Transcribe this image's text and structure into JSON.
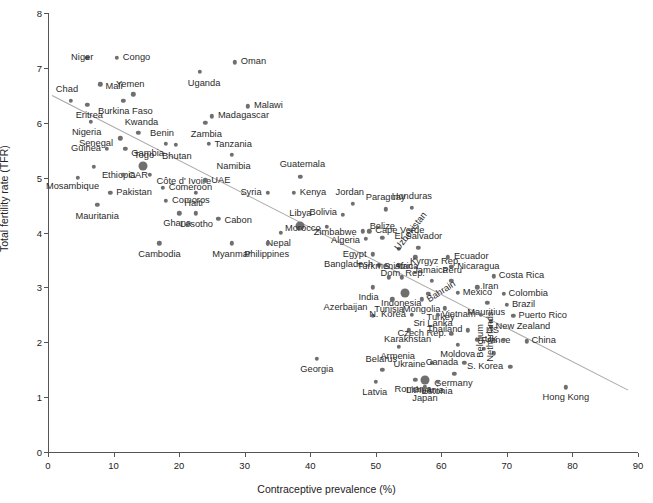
{
  "chart_data": {
    "type": "scatter",
    "title": "",
    "xlabel": "Contraceptive prevalence (%)",
    "ylabel": "Total fertility rate (TFR)",
    "xlim": [
      0,
      90
    ],
    "ylim": [
      0,
      8
    ],
    "xticks": [
      0,
      10,
      20,
      30,
      40,
      50,
      60,
      70,
      80,
      90
    ],
    "yticks": [
      0,
      1,
      2,
      3,
      4,
      5,
      6,
      7,
      8
    ],
    "grid": false,
    "legend": null,
    "point_color": "#6f6f6f",
    "trendline_color": "#a8a8a8",
    "trendline": {
      "x0": 0.6,
      "y0": 6.5,
      "x1": 88.5,
      "y1": 1.13
    },
    "points": [
      {
        "name": "Niger",
        "x": 6.0,
        "y": 7.18,
        "lx": 6,
        "ly": 0,
        "a": "r",
        "big": false
      },
      {
        "name": "Congo",
        "x": 10.5,
        "y": 7.18,
        "lx": 6,
        "ly": 0,
        "a": "l",
        "big": false
      },
      {
        "name": "Oman",
        "x": 28.5,
        "y": 7.1,
        "lx": 6,
        "ly": 0,
        "a": "l",
        "big": false
      },
      {
        "name": "Uganda",
        "x": 23.2,
        "y": 6.93,
        "lx": 4,
        "ly": 12,
        "a": "c",
        "big": false
      },
      {
        "name": "Mali",
        "x": 8.0,
        "y": 6.7,
        "lx": 5,
        "ly": 3,
        "a": "l",
        "big": false
      },
      {
        "name": "Yemen",
        "x": 13.0,
        "y": 6.52,
        "lx": -3,
        "ly": -9,
        "a": "c",
        "big": false
      },
      {
        "name": "Chad",
        "x": 3.5,
        "y": 6.4,
        "lx": -4,
        "ly": -11,
        "a": "c",
        "big": false
      },
      {
        "name": "Burkina Faso",
        "x": 11.5,
        "y": 6.4,
        "lx": 2,
        "ly": 11,
        "a": "c",
        "big": false
      },
      {
        "name": "Malawi",
        "x": 30.5,
        "y": 6.3,
        "lx": 6,
        "ly": 0,
        "a": "l",
        "big": false
      },
      {
        "name": "Eritrea",
        "x": 6.0,
        "y": 6.33,
        "lx": 2,
        "ly": 11,
        "a": "c",
        "big": false
      },
      {
        "name": "Madagascar",
        "x": 25.0,
        "y": 6.12,
        "lx": 6,
        "ly": 0,
        "a": "l",
        "big": false
      },
      {
        "name": "Nigeria",
        "x": 6.5,
        "y": 6.02,
        "lx": -4,
        "ly": 11,
        "a": "c",
        "big": false
      },
      {
        "name": "Zambia",
        "x": 24.0,
        "y": 6.0,
        "lx": 1,
        "ly": 12,
        "a": "c",
        "big": false
      },
      {
        "name": "Kwanda",
        "x": 13.8,
        "y": 5.82,
        "lx": 3,
        "ly": -10,
        "a": "c",
        "big": false
      },
      {
        "name": "Senegal",
        "x": 11.0,
        "y": 5.72,
        "lx": -7,
        "ly": 6,
        "a": "r",
        "big": false
      },
      {
        "name": "Benin",
        "x": 18.0,
        "y": 5.62,
        "lx": -4,
        "ly": -10,
        "a": "c",
        "big": false
      },
      {
        "name": "Tanzania",
        "x": 24.5,
        "y": 5.62,
        "lx": 6,
        "ly": 1,
        "a": "l",
        "big": false
      },
      {
        "name": "Guinea",
        "x": 9.0,
        "y": 5.52,
        "lx": -6,
        "ly": 0,
        "a": "r",
        "big": false
      },
      {
        "name": "Gambia",
        "x": 11.8,
        "y": 5.52,
        "lx": 6,
        "ly": 5,
        "a": "l",
        "big": false
      },
      {
        "name": "Bhutan",
        "x": 19.5,
        "y": 5.6,
        "lx": 1,
        "ly": 12,
        "a": "c",
        "big": false
      },
      {
        "name": "Namibia",
        "x": 28.0,
        "y": 5.42,
        "lx": 2,
        "ly": 12,
        "a": "c",
        "big": false
      },
      {
        "name": "Ethiopia",
        "x": 7.0,
        "y": 5.2,
        "lx": 8,
        "ly": 9,
        "a": "l",
        "big": false
      },
      {
        "name": "Togo",
        "x": 14.5,
        "y": 5.22,
        "lx": 1,
        "ly": -10,
        "a": "c",
        "big": true
      },
      {
        "name": "CAR",
        "x": 11.5,
        "y": 5.05,
        "lx": 5,
        "ly": 1,
        "a": "l",
        "big": false
      },
      {
        "name": "Côte d' Ivoire",
        "x": 15.5,
        "y": 5.05,
        "lx": 7,
        "ly": 7,
        "a": "l",
        "big": false
      },
      {
        "name": "Guatemala",
        "x": 38.5,
        "y": 5.02,
        "lx": 2,
        "ly": -12,
        "a": "c",
        "big": false
      },
      {
        "name": "Mosambique",
        "x": 4.5,
        "y": 5.0,
        "lx": -5,
        "ly": 9,
        "a": "c",
        "big": false
      },
      {
        "name": "UAE",
        "x": 24.0,
        "y": 4.95,
        "lx": 6,
        "ly": 1,
        "a": "l",
        "big": false
      },
      {
        "name": "Comeroon",
        "x": 17.5,
        "y": 4.82,
        "lx": 6,
        "ly": 0,
        "a": "l",
        "big": false
      },
      {
        "name": "Pakistan",
        "x": 9.5,
        "y": 4.72,
        "lx": 6,
        "ly": 0,
        "a": "l",
        "big": false
      },
      {
        "name": "Syria",
        "x": 33.5,
        "y": 4.72,
        "lx": -6,
        "ly": 0,
        "a": "r",
        "big": false
      },
      {
        "name": "Kenya",
        "x": 37.5,
        "y": 4.72,
        "lx": 6,
        "ly": 0,
        "a": "l",
        "big": false
      },
      {
        "name": "Haiti",
        "x": 22.5,
        "y": 4.72,
        "lx": -2,
        "ly": 11,
        "a": "c",
        "big": false
      },
      {
        "name": "Comoros",
        "x": 18.0,
        "y": 4.58,
        "lx": 6,
        "ly": 0,
        "a": "l",
        "big": false
      },
      {
        "name": "Jordan",
        "x": 46.5,
        "y": 4.52,
        "lx": -3,
        "ly": -11,
        "a": "c",
        "big": false
      },
      {
        "name": "Paraguay",
        "x": 51.5,
        "y": 4.42,
        "lx": 0,
        "ly": -11,
        "a": "c",
        "big": false
      },
      {
        "name": "Honduras",
        "x": 55.5,
        "y": 4.45,
        "lx": 0,
        "ly": -11,
        "a": "c",
        "big": false
      },
      {
        "name": "Mauritania",
        "x": 7.5,
        "y": 4.5,
        "lx": 0,
        "ly": 12,
        "a": "c",
        "big": false
      },
      {
        "name": "Bolivia",
        "x": 45.0,
        "y": 4.32,
        "lx": -6,
        "ly": -2,
        "a": "r",
        "big": false
      },
      {
        "name": "Ghana",
        "x": 20.0,
        "y": 4.35,
        "lx": -2,
        "ly": 11,
        "a": "c",
        "big": false
      },
      {
        "name": "Lesotho",
        "x": 22.5,
        "y": 4.35,
        "lx": 1,
        "ly": 12,
        "a": "c",
        "big": false
      },
      {
        "name": "Cabon",
        "x": 26.0,
        "y": 4.25,
        "lx": 6,
        "ly": 2,
        "a": "l",
        "big": false
      },
      {
        "name": "Libya",
        "x": 38.5,
        "y": 4.12,
        "lx": 0,
        "ly": -12,
        "a": "c",
        "big": true
      },
      {
        "name": "Morocco",
        "x": 42.5,
        "y": 4.1,
        "lx": -6,
        "ly": 2,
        "a": "r",
        "big": false
      },
      {
        "name": "Zimbabwe",
        "x": 48.0,
        "y": 4.02,
        "lx": -6,
        "ly": 2,
        "a": "r",
        "big": false
      },
      {
        "name": "Cape Verde",
        "x": 49.0,
        "y": 4.02,
        "lx": 6,
        "ly": 0,
        "a": "l",
        "big": false
      },
      {
        "name": "Nepal",
        "x": 35.5,
        "y": 4.0,
        "lx": -2,
        "ly": 11,
        "a": "c",
        "big": false
      },
      {
        "name": "Belize",
        "x": 51.0,
        "y": 3.9,
        "lx": 0,
        "ly": -11,
        "a": "c",
        "big": false
      },
      {
        "name": "Algeria",
        "x": 48.5,
        "y": 3.88,
        "lx": -6,
        "ly": 2,
        "a": "r",
        "big": false
      },
      {
        "name": "Philippines",
        "x": 33.5,
        "y": 3.8,
        "lx": -1,
        "ly": 12,
        "a": "c",
        "big": false
      },
      {
        "name": "Uzbekistan",
        "x": 53.5,
        "y": 3.7,
        "lx": -2,
        "ly": -4,
        "a": "rot",
        "big": false,
        "rot": -52
      },
      {
        "name": "Cambodia",
        "x": 17.0,
        "y": 3.8,
        "lx": 0,
        "ly": 12,
        "a": "c",
        "big": false
      },
      {
        "name": "Myanmar",
        "x": 28.0,
        "y": 3.8,
        "lx": 0,
        "ly": 12,
        "a": "c",
        "big": false
      },
      {
        "name": "El Salvador",
        "x": 56.5,
        "y": 3.72,
        "lx": 0,
        "ly": -11,
        "a": "c",
        "big": false
      },
      {
        "name": "Egypt",
        "x": 49.5,
        "y": 3.6,
        "lx": -6,
        "ly": 1,
        "a": "r",
        "big": false
      },
      {
        "name": "Kyrgyz Rep.",
        "x": 56.0,
        "y": 3.55,
        "lx": -5,
        "ly": 5,
        "a": "l",
        "big": false
      },
      {
        "name": "Ecuador",
        "x": 61.0,
        "y": 3.55,
        "lx": 6,
        "ly": 0,
        "a": "l",
        "big": false
      },
      {
        "name": "Bangladesh",
        "x": 50.5,
        "y": 3.4,
        "lx": -6,
        "ly": 0,
        "a": "r",
        "big": false
      },
      {
        "name": "Dom. Rep.",
        "x": 53.5,
        "y": 3.4,
        "lx": 4,
        "ly": 9,
        "a": "c",
        "big": false
      },
      {
        "name": "Nicaragua",
        "x": 61.5,
        "y": 3.38,
        "lx": 6,
        "ly": 0,
        "a": "l",
        "big": false
      },
      {
        "name": "Costa Rica",
        "x": 68.0,
        "y": 3.2,
        "lx": 5,
        "ly": 0,
        "a": "l",
        "big": false
      },
      {
        "name": "Turkmenistan",
        "x": 52.0,
        "y": 3.18,
        "lx": -4,
        "ly": -10,
        "a": "c",
        "big": false
      },
      {
        "name": "S. Africa",
        "x": 54.0,
        "y": 3.18,
        "lx": -1,
        "ly": -10,
        "a": "c",
        "big": false
      },
      {
        "name": "Jamaica",
        "x": 58.5,
        "y": 3.12,
        "lx": -1,
        "ly": -10,
        "a": "c",
        "big": false
      },
      {
        "name": "Peru",
        "x": 61.5,
        "y": 3.12,
        "lx": 1,
        "ly": -10,
        "a": "c",
        "big": false
      },
      {
        "name": "Iran",
        "x": 65.5,
        "y": 3.0,
        "lx": 5,
        "ly": 0,
        "a": "l",
        "big": false
      },
      {
        "name": "India",
        "x": 49.5,
        "y": 3.0,
        "lx": -4,
        "ly": 11,
        "a": "c",
        "big": false
      },
      {
        "name": "Indonesia",
        "x": 54.5,
        "y": 2.9,
        "lx": -4,
        "ly": 11,
        "a": "c",
        "big": true
      },
      {
        "name": "Mexico",
        "x": 62.5,
        "y": 2.9,
        "lx": 5,
        "ly": 0,
        "a": "l",
        "big": false
      },
      {
        "name": "Colombia",
        "x": 69.5,
        "y": 2.88,
        "lx": 5,
        "ly": 0,
        "a": "l",
        "big": false
      },
      {
        "name": "Bahrain",
        "x": 58.0,
        "y": 2.88,
        "lx": 0,
        "ly": 2,
        "a": "rot",
        "big": false,
        "rot": -33
      },
      {
        "name": "Tunisia",
        "x": 52.5,
        "y": 2.78,
        "lx": -3,
        "ly": 11,
        "a": "c",
        "big": false
      },
      {
        "name": "Mongolia",
        "x": 57.0,
        "y": 2.78,
        "lx": 0,
        "ly": 11,
        "a": "c",
        "big": false
      },
      {
        "name": "Mauritius",
        "x": 67.0,
        "y": 2.72,
        "lx": -1,
        "ly": 10,
        "a": "c",
        "big": false
      },
      {
        "name": "Brazil",
        "x": 70.0,
        "y": 2.68,
        "lx": 5,
        "ly": 0,
        "a": "l",
        "big": false
      },
      {
        "name": "Turkey",
        "x": 60.5,
        "y": 2.62,
        "lx": -4,
        "ly": 10,
        "a": "c",
        "big": false
      },
      {
        "name": "Azerbaijan",
        "x": 49.5,
        "y": 2.48,
        "lx": -5,
        "ly": -8,
        "a": "r",
        "big": false
      },
      {
        "name": "N. Korea",
        "x": 55.5,
        "y": 2.5,
        "lx": -6,
        "ly": 0,
        "a": "r",
        "big": false
      },
      {
        "name": "Sri Lanka",
        "x": 59.5,
        "y": 2.5,
        "lx": -5,
        "ly": 9,
        "a": "c",
        "big": false
      },
      {
        "name": "Vietnam",
        "x": 66.0,
        "y": 2.5,
        "lx": -5,
        "ly": 0,
        "a": "r",
        "big": false
      },
      {
        "name": "Puerto Rico",
        "x": 71.0,
        "y": 2.48,
        "lx": 5,
        "ly": 0,
        "a": "l",
        "big": false
      },
      {
        "name": "US",
        "x": 67.5,
        "y": 2.38,
        "lx": 2,
        "ly": 10,
        "a": "c",
        "big": false
      },
      {
        "name": "New Zealand",
        "x": 67.5,
        "y": 2.28,
        "lx": 5,
        "ly": 0,
        "a": "l",
        "big": false
      },
      {
        "name": "Thailand",
        "x": 64.0,
        "y": 2.22,
        "lx": -5,
        "ly": 0,
        "a": "r",
        "big": false
      },
      {
        "name": "Karakhstan",
        "x": 55.0,
        "y": 2.22,
        "lx": -1,
        "ly": 10,
        "a": "c",
        "big": false
      },
      {
        "name": "Czech Rep.",
        "x": 61.5,
        "y": 2.15,
        "lx": -5,
        "ly": 0,
        "a": "r",
        "big": false
      },
      {
        "name": "France",
        "x": 65.5,
        "y": 2.05,
        "lx": 4,
        "ly": 1,
        "a": "l",
        "big": false
      },
      {
        "name": "UK",
        "x": 69.5,
        "y": 2.05,
        "lx": -6,
        "ly": 0,
        "a": "r",
        "big": false
      },
      {
        "name": "China",
        "x": 73.0,
        "y": 2.02,
        "lx": 5,
        "ly": 0,
        "a": "l",
        "big": false
      },
      {
        "name": "Moldova",
        "x": 62.5,
        "y": 1.95,
        "lx": 0,
        "ly": 10,
        "a": "c",
        "big": false
      },
      {
        "name": "Armenia",
        "x": 53.5,
        "y": 1.92,
        "lx": -1,
        "ly": 10,
        "a": "c",
        "big": false
      },
      {
        "name": "Belgium",
        "x": 66.5,
        "y": 1.88,
        "lx": -3,
        "ly": 4,
        "a": "rot",
        "big": false,
        "rot": -90
      },
      {
        "name": "Netherlands",
        "x": 68.0,
        "y": 1.8,
        "lx": -3,
        "ly": 4,
        "a": "rot",
        "big": false,
        "rot": -90
      },
      {
        "name": "Ukraine",
        "x": 58.5,
        "y": 1.62,
        "lx": -6,
        "ly": 2,
        "a": "r",
        "big": false
      },
      {
        "name": "Canada",
        "x": 63.5,
        "y": 1.62,
        "lx": -6,
        "ly": 0,
        "a": "r",
        "big": false
      },
      {
        "name": "S. Korea",
        "x": 70.5,
        "y": 1.55,
        "lx": -7,
        "ly": 0,
        "a": "r",
        "big": false
      },
      {
        "name": "Georgia",
        "x": 41.0,
        "y": 1.7,
        "lx": 0,
        "ly": 11,
        "a": "c",
        "big": false
      },
      {
        "name": "Belarus",
        "x": 51.0,
        "y": 1.5,
        "lx": -1,
        "ly": -10,
        "a": "c",
        "big": false
      },
      {
        "name": "Germany",
        "x": 62.0,
        "y": 1.42,
        "lx": -1,
        "ly": 10,
        "a": "c",
        "big": false
      },
      {
        "name": "Romania",
        "x": 56.0,
        "y": 1.32,
        "lx": -2,
        "ly": 10,
        "a": "c",
        "big": false
      },
      {
        "name": "Estonia",
        "x": 59.5,
        "y": 1.28,
        "lx": -1,
        "ly": 10,
        "a": "c",
        "big": false
      },
      {
        "name": "Lithuania",
        "x": 57.5,
        "y": 1.32,
        "lx": 0,
        "ly": 11,
        "a": "c",
        "big": true
      },
      {
        "name": "Latvia",
        "x": 50.0,
        "y": 1.28,
        "lx": -1,
        "ly": 11,
        "a": "c",
        "big": false
      },
      {
        "name": "Japan",
        "x": 57.5,
        "y": 1.18,
        "lx": 0,
        "ly": 12,
        "a": "c",
        "big": false
      },
      {
        "name": "Hong Kong",
        "x": 79.0,
        "y": 1.18,
        "lx": 0,
        "ly": 11,
        "a": "c",
        "big": false
      }
    ]
  }
}
